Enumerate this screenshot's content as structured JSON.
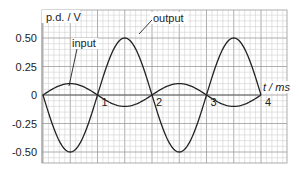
{
  "chart_data": {
    "type": "line",
    "title": "",
    "xlabel": "t / ms",
    "ylabel": "p.d. / V",
    "xlim": [
      0,
      4.5
    ],
    "ylim": [
      -0.55,
      0.6
    ],
    "grid": true,
    "grid_minor_x": 0.1,
    "grid_minor_y": 0.05,
    "x_ticks": [
      {
        "value": 1,
        "label": "1"
      },
      {
        "value": 2,
        "label": "2"
      },
      {
        "value": 3,
        "label": "3"
      },
      {
        "value": 4,
        "label": "4"
      }
    ],
    "y_ticks": [
      {
        "value": 0.5,
        "label": "0.50"
      },
      {
        "value": 0.25,
        "label": "0.25"
      },
      {
        "value": 0,
        "label": "0"
      },
      {
        "value": -0.25,
        "label": "-0.25"
      },
      {
        "value": -0.5,
        "label": "-0.50"
      }
    ],
    "series": [
      {
        "name": "input",
        "function": "sine",
        "amplitude": 0.1,
        "period_ms": 2,
        "phase": "starts at 0 rising",
        "t_range": [
          0,
          4
        ],
        "key_points": [
          [
            0,
            0
          ],
          [
            0.5,
            0.1
          ],
          [
            1,
            0
          ],
          [
            1.5,
            -0.1
          ],
          [
            2,
            0
          ],
          [
            2.5,
            0.1
          ],
          [
            3,
            0
          ],
          [
            3.5,
            -0.1
          ],
          [
            4,
            0
          ]
        ]
      },
      {
        "name": "output",
        "function": "inverted sine",
        "amplitude": 0.5,
        "period_ms": 2,
        "phase": "starts at 0 falling",
        "t_range": [
          0,
          4
        ],
        "key_points": [
          [
            0,
            0
          ],
          [
            0.5,
            -0.5
          ],
          [
            1,
            0
          ],
          [
            1.5,
            0.5
          ],
          [
            2,
            0
          ],
          [
            2.5,
            -0.5
          ],
          [
            3,
            0
          ],
          [
            3.5,
            0.5
          ],
          [
            4,
            0
          ]
        ]
      }
    ],
    "annotations": [
      {
        "text": "input",
        "points_to": "input"
      },
      {
        "text": "output",
        "points_to": "output"
      }
    ],
    "colors": {
      "grid_major": "#9a9a9a",
      "grid_minor": "#c8c8c8",
      "curve": "#222222",
      "text": "#222222"
    }
  }
}
